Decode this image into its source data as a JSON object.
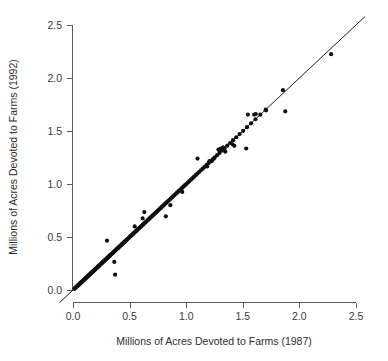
{
  "chart_data": {
    "type": "scatter",
    "title": "",
    "xlabel": "Millions of Acres Devoted to Farms (1987)",
    "ylabel": "Millions of Acres Devoted to Farms (1992)",
    "xlim": [
      -0.12,
      2.62
    ],
    "ylim": [
      -0.12,
      2.62
    ],
    "xticks": [
      0.0,
      0.5,
      1.0,
      1.5,
      2.0,
      2.5
    ],
    "yticks": [
      0.0,
      0.5,
      1.0,
      1.5,
      2.0,
      2.5
    ],
    "xticklabels": [
      "0.0",
      "0.5",
      "1.0",
      "1.5",
      "2.0",
      "2.5"
    ],
    "yticklabels": [
      "0.0",
      "0.5",
      "1.0",
      "1.5",
      "2.0",
      "2.5"
    ],
    "grid": false,
    "legend": null,
    "marker": {
      "shape": "circle",
      "size_px": 2.1,
      "color": "#101010"
    },
    "annotations": [
      {
        "type": "line",
        "name": "identity-reference-line",
        "from": [
          -0.12,
          -0.12
        ],
        "to": [
          2.58,
          2.58
        ],
        "color": "#1c1c1c",
        "width": 1
      }
    ],
    "series": [
      {
        "name": "counties",
        "x": [
          0.012,
          0.018,
          0.022,
          0.026,
          0.03,
          0.033,
          0.036,
          0.04,
          0.043,
          0.046,
          0.05,
          0.053,
          0.056,
          0.06,
          0.063,
          0.066,
          0.07,
          0.073,
          0.076,
          0.08,
          0.083,
          0.086,
          0.09,
          0.094,
          0.097,
          0.1,
          0.104,
          0.107,
          0.111,
          0.114,
          0.118,
          0.121,
          0.125,
          0.128,
          0.132,
          0.136,
          0.14,
          0.143,
          0.147,
          0.151,
          0.155,
          0.158,
          0.162,
          0.166,
          0.17,
          0.174,
          0.178,
          0.182,
          0.186,
          0.19,
          0.194,
          0.198,
          0.202,
          0.206,
          0.21,
          0.215,
          0.219,
          0.223,
          0.228,
          0.232,
          0.236,
          0.241,
          0.245,
          0.25,
          0.254,
          0.259,
          0.263,
          0.268,
          0.272,
          0.277,
          0.282,
          0.286,
          0.291,
          0.296,
          0.3,
          0.305,
          0.31,
          0.315,
          0.32,
          0.325,
          0.33,
          0.335,
          0.34,
          0.345,
          0.35,
          0.355,
          0.36,
          0.366,
          0.371,
          0.376,
          0.382,
          0.387,
          0.393,
          0.398,
          0.404,
          0.409,
          0.415,
          0.421,
          0.427,
          0.433,
          0.439,
          0.445,
          0.451,
          0.457,
          0.463,
          0.469,
          0.475,
          0.481,
          0.487,
          0.493,
          0.5,
          0.506,
          0.512,
          0.519,
          0.525,
          0.532,
          0.538,
          0.545,
          0.552,
          0.558,
          0.565,
          0.572,
          0.579,
          0.586,
          0.593,
          0.6,
          0.607,
          0.615,
          0.622,
          0.63,
          0.637,
          0.645,
          0.652,
          0.66,
          0.668,
          0.676,
          0.684,
          0.692,
          0.7,
          0.708,
          0.717,
          0.725,
          0.734,
          0.742,
          0.751,
          0.76,
          0.769,
          0.778,
          0.787,
          0.797,
          0.806,
          0.816,
          0.825,
          0.835,
          0.845,
          0.855,
          0.866,
          0.876,
          0.887,
          0.897,
          0.908,
          0.919,
          0.931,
          0.942,
          0.954,
          0.966,
          0.978,
          0.99,
          1.003,
          1.016,
          1.029,
          1.042,
          1.056,
          1.07,
          1.084,
          1.099,
          1.114,
          1.13,
          1.146,
          1.162,
          1.179,
          1.197,
          1.215,
          1.234,
          1.253,
          1.273,
          1.294,
          1.316,
          1.339,
          1.363,
          1.388,
          1.414,
          1.442,
          1.472,
          1.503,
          1.537,
          1.573,
          1.612,
          1.655,
          1.702,
          0.3,
          0.365,
          0.372,
          0.545,
          0.615,
          0.63,
          0.82,
          0.86,
          0.965,
          1.1,
          1.185,
          1.205,
          1.225,
          1.245,
          1.285,
          1.305,
          1.325,
          1.345,
          1.41,
          1.425,
          1.53,
          1.545,
          1.6,
          1.615,
          1.705,
          1.855,
          1.875,
          2.28
        ],
        "y": [
          0.011,
          0.017,
          0.021,
          0.025,
          0.029,
          0.032,
          0.035,
          0.039,
          0.042,
          0.045,
          0.049,
          0.052,
          0.055,
          0.059,
          0.062,
          0.065,
          0.069,
          0.072,
          0.075,
          0.079,
          0.082,
          0.085,
          0.089,
          0.093,
          0.096,
          0.099,
          0.103,
          0.106,
          0.11,
          0.113,
          0.117,
          0.12,
          0.124,
          0.127,
          0.131,
          0.135,
          0.139,
          0.142,
          0.146,
          0.15,
          0.154,
          0.157,
          0.161,
          0.165,
          0.169,
          0.173,
          0.177,
          0.181,
          0.185,
          0.189,
          0.193,
          0.197,
          0.201,
          0.205,
          0.209,
          0.214,
          0.218,
          0.222,
          0.227,
          0.231,
          0.235,
          0.24,
          0.244,
          0.249,
          0.253,
          0.258,
          0.262,
          0.267,
          0.271,
          0.276,
          0.281,
          0.285,
          0.29,
          0.295,
          0.299,
          0.304,
          0.309,
          0.314,
          0.319,
          0.324,
          0.329,
          0.334,
          0.339,
          0.344,
          0.349,
          0.354,
          0.359,
          0.365,
          0.37,
          0.375,
          0.381,
          0.386,
          0.392,
          0.397,
          0.403,
          0.408,
          0.414,
          0.42,
          0.426,
          0.432,
          0.438,
          0.444,
          0.45,
          0.456,
          0.462,
          0.468,
          0.474,
          0.48,
          0.486,
          0.492,
          0.499,
          0.505,
          0.511,
          0.518,
          0.524,
          0.531,
          0.537,
          0.544,
          0.551,
          0.557,
          0.564,
          0.571,
          0.578,
          0.585,
          0.592,
          0.599,
          0.606,
          0.614,
          0.621,
          0.629,
          0.636,
          0.644,
          0.651,
          0.659,
          0.667,
          0.675,
          0.683,
          0.691,
          0.699,
          0.707,
          0.716,
          0.724,
          0.733,
          0.741,
          0.75,
          0.759,
          0.768,
          0.777,
          0.786,
          0.796,
          0.805,
          0.815,
          0.824,
          0.834,
          0.844,
          0.854,
          0.865,
          0.875,
          0.886,
          0.896,
          0.907,
          0.918,
          0.93,
          0.941,
          0.953,
          0.965,
          0.977,
          0.989,
          1.002,
          1.015,
          1.028,
          1.041,
          1.055,
          1.069,
          1.083,
          1.098,
          1.113,
          1.129,
          1.145,
          1.161,
          1.178,
          1.196,
          1.214,
          1.233,
          1.252,
          1.272,
          1.293,
          1.315,
          1.338,
          1.362,
          1.387,
          1.413,
          1.441,
          1.471,
          1.502,
          1.536,
          1.572,
          1.611,
          1.654,
          1.701,
          0.465,
          0.265,
          0.145,
          0.6,
          0.675,
          0.735,
          0.695,
          0.8,
          0.925,
          1.24,
          1.165,
          1.215,
          1.215,
          1.24,
          1.325,
          1.335,
          1.345,
          1.305,
          1.375,
          1.36,
          1.335,
          1.655,
          1.655,
          1.66,
          1.695,
          1.885,
          1.685,
          2.225
        ]
      }
    ]
  }
}
